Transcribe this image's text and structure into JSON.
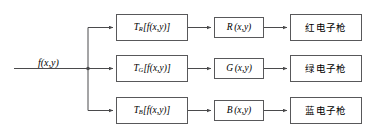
{
  "diagram": {
    "input": {
      "label": "f(x,y)"
    },
    "colors": {
      "box_border": "#58585a",
      "wire": "#4a4a4c",
      "text": "#000000",
      "background": "#ffffff"
    },
    "rows": [
      {
        "key": "red",
        "transform_symbol": "T",
        "transform_subscript": "R",
        "transform_arg": "[f(x,y)]",
        "channel_letter": "R",
        "channel_arg": "(x,y)",
        "gun_label": "红电子枪"
      },
      {
        "key": "green",
        "transform_symbol": "T",
        "transform_subscript": "G",
        "transform_arg": "[f(x,y)]",
        "channel_letter": "G",
        "channel_arg": "(x,y)",
        "gun_label": "绿电子枪"
      },
      {
        "key": "blue",
        "transform_symbol": "T",
        "transform_subscript": "B",
        "transform_arg": "[f(x,y)]",
        "channel_letter": "B",
        "channel_arg": "(x,y)",
        "gun_label": "蓝电子枪"
      }
    ]
  }
}
